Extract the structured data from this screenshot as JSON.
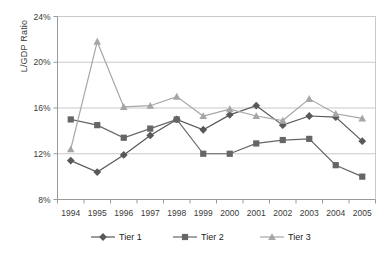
{
  "chart_data": {
    "type": "line",
    "title": "",
    "xlabel": "",
    "ylabel": "L/GDP Ratio",
    "categories": [
      "1994",
      "1995",
      "1996",
      "1997",
      "1998",
      "1999",
      "2000",
      "2001",
      "2002",
      "2003",
      "2004",
      "2005"
    ],
    "ylim": [
      8,
      24
    ],
    "ytick_labels": [
      "8%",
      "12%",
      "16%",
      "20%",
      "24%"
    ],
    "ytick_values": [
      8,
      12,
      16,
      20,
      24
    ],
    "grid": "horizontal",
    "legend_position": "bottom",
    "series": [
      {
        "name": "Tier 1",
        "marker": "diamond",
        "color": "#595959",
        "values": [
          11.4,
          10.4,
          11.9,
          13.6,
          15.0,
          14.1,
          15.4,
          16.2,
          14.5,
          15.3,
          15.2,
          13.1
        ]
      },
      {
        "name": "Tier 2",
        "marker": "square",
        "color": "#666666",
        "values": [
          15.0,
          14.5,
          13.4,
          14.2,
          15.0,
          12.0,
          12.0,
          12.9,
          13.2,
          13.3,
          11.0,
          10.0
        ]
      },
      {
        "name": "Tier 3",
        "marker": "triangle",
        "color": "#a6a6a6",
        "values": [
          12.4,
          21.8,
          16.1,
          16.2,
          17.0,
          15.3,
          15.9,
          15.3,
          14.9,
          16.8,
          15.5,
          15.1
        ]
      }
    ]
  },
  "axes": {
    "y_title": "L/GDP Ratio"
  },
  "legend": {
    "items": [
      {
        "label": "Tier 1"
      },
      {
        "label": "Tier 2"
      },
      {
        "label": "Tier 3"
      }
    ]
  },
  "colors": {
    "tier1": "#595959",
    "tier2": "#666666",
    "tier3": "#a6a6a6",
    "grid": "#c9c9c9",
    "frame": "#9a9a9a",
    "text": "#3a3a3a"
  }
}
